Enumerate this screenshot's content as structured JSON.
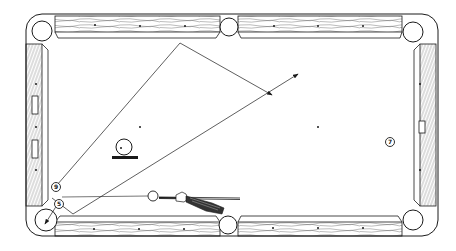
{
  "colors": {
    "ink": "#1a1a1a",
    "background": "#ffffff",
    "wood_grain": "#555555"
  },
  "balls": [
    {
      "id": "nine-ball",
      "label": "9",
      "kind": "object"
    },
    {
      "id": "five-ball",
      "label": "5",
      "kind": "object"
    },
    {
      "id": "seven-ball",
      "label": "7",
      "kind": "object"
    },
    {
      "id": "cue-ball",
      "label": "",
      "kind": "cue"
    },
    {
      "id": "spin-indicator-ball",
      "label": "",
      "kind": "english-indicator"
    }
  ],
  "paths": [
    {
      "id": "bank-path",
      "description": "Object ball banks off top rail toward center",
      "arrow": true
    },
    {
      "id": "cue-ball-path",
      "description": "Cue ball path off bottom-left toward upper right",
      "arrow": true
    },
    {
      "id": "pocket-path",
      "description": "Ball into bottom-left corner pocket",
      "arrow": true
    }
  ],
  "table": {
    "pockets": [
      "top-left",
      "top-middle",
      "top-right",
      "bottom-left",
      "bottom-middle",
      "bottom-right"
    ],
    "diamonds_per_long_rail_section": 3,
    "diamonds_per_short_rail": 3
  }
}
